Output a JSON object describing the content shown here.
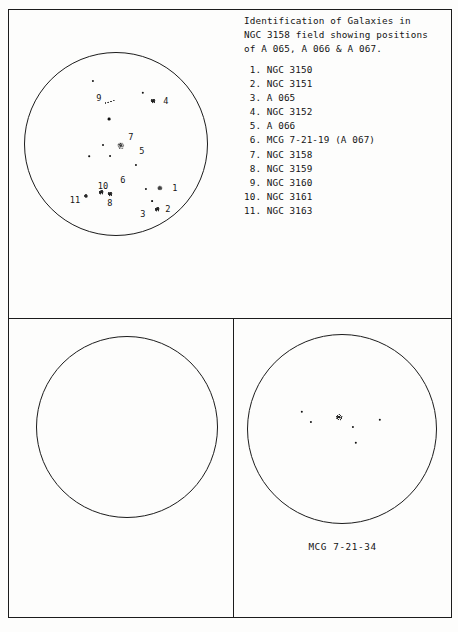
{
  "caption": {
    "line1": "Identification of Galaxies in",
    "line2": "NGC 3158 field showing positions",
    "line3": "of A 065, A 066 & A 067."
  },
  "legend": {
    "items": [
      {
        "num": " 1.",
        "name": "NGC 3150"
      },
      {
        "num": " 2.",
        "name": "NGC 3151"
      },
      {
        "num": " 3.",
        "name": "A 065"
      },
      {
        "num": " 4.",
        "name": "NGC 3152"
      },
      {
        "num": " 5.",
        "name": "A 066"
      },
      {
        "num": " 6.",
        "name": "MCG 7-21-19 (A 067)"
      },
      {
        "num": " 7.",
        "name": "NGC 3158"
      },
      {
        "num": " 8.",
        "name": "NGC 3159"
      },
      {
        "num": " 9.",
        "name": "NGC 3160"
      },
      {
        "num": "10.",
        "name": "NGC 3161"
      },
      {
        "num": "11.",
        "name": "NGC 3163"
      }
    ]
  },
  "plates": {
    "top": {
      "name": "ngc-3158-field-plate",
      "labels": [
        {
          "id": "1",
          "x": 175,
          "y": 188
        },
        {
          "id": "2",
          "x": 168,
          "y": 209
        },
        {
          "id": "3",
          "x": 143,
          "y": 214
        },
        {
          "id": "4",
          "x": 166,
          "y": 101
        },
        {
          "id": "5",
          "x": 142,
          "y": 151
        },
        {
          "id": "6",
          "x": 123,
          "y": 180
        },
        {
          "id": "7",
          "x": 131,
          "y": 137
        },
        {
          "id": "8",
          "x": 110,
          "y": 203
        },
        {
          "id": "9",
          "x": 99,
          "y": 98
        },
        {
          "id": "10",
          "x": 103,
          "y": 186
        },
        {
          "id": "11",
          "x": 75,
          "y": 200
        }
      ],
      "objects": [
        {
          "kind": "gal",
          "x": 160,
          "y": 188,
          "size": 5.2
        },
        {
          "kind": "gal",
          "x": 157,
          "y": 209,
          "size": 4.6
        },
        {
          "kind": "smudge",
          "x": 151,
          "y": 213,
          "size": 3.6
        },
        {
          "kind": "gal",
          "x": 153,
          "y": 101,
          "size": 5.0
        },
        {
          "kind": "smudge",
          "x": 133,
          "y": 151,
          "size": 3.8
        },
        {
          "kind": "smudge",
          "x": 119,
          "y": 182,
          "size": 4.0
        },
        {
          "kind": "gal",
          "x": 121,
          "y": 146,
          "size": 7.4
        },
        {
          "kind": "gal",
          "x": 110,
          "y": 194,
          "size": 5.0
        },
        {
          "kind": "streak",
          "x": 110,
          "y": 102,
          "w": 12,
          "h": 5
        },
        {
          "kind": "gal",
          "x": 101,
          "y": 192,
          "size": 4.6
        },
        {
          "kind": "gal",
          "x": 86,
          "y": 196,
          "size": 4.2
        },
        {
          "kind": "star",
          "x": 93,
          "y": 81,
          "size": 2.2
        },
        {
          "kind": "star",
          "x": 143,
          "y": 93,
          "size": 2.4
        },
        {
          "kind": "star",
          "x": 109,
          "y": 119,
          "size": 2.8
        },
        {
          "kind": "star",
          "x": 103,
          "y": 145,
          "size": 2.0
        },
        {
          "kind": "star",
          "x": 110,
          "y": 156,
          "size": 1.9
        },
        {
          "kind": "star",
          "x": 89,
          "y": 156,
          "size": 1.6
        },
        {
          "kind": "star",
          "x": 136,
          "y": 165,
          "size": 2.1
        },
        {
          "kind": "star",
          "x": 146,
          "y": 189,
          "size": 2.2
        },
        {
          "kind": "star",
          "x": 152,
          "y": 201,
          "size": 1.8
        }
      ]
    },
    "bottom_left": {
      "name": "blank-plate",
      "objects": []
    },
    "bottom_right": {
      "name": "mcg-7-21-34-plate",
      "label": "MCG 7-21-34",
      "objects": [
        {
          "kind": "star",
          "x": 353,
          "y": 427,
          "size": 2.2
        },
        {
          "kind": "star",
          "x": 302,
          "y": 412,
          "size": 2.4
        },
        {
          "kind": "star",
          "x": 356,
          "y": 443,
          "size": 2.4
        },
        {
          "kind": "star",
          "x": 380,
          "y": 420,
          "size": 2.4
        },
        {
          "kind": "star",
          "x": 311,
          "y": 422,
          "size": 2.2
        },
        {
          "kind": "gal",
          "x": 339,
          "y": 417,
          "size": 6.6
        }
      ]
    }
  },
  "colors": {
    "ink": "#1c1c1c",
    "paper": "#fdfdfc"
  }
}
